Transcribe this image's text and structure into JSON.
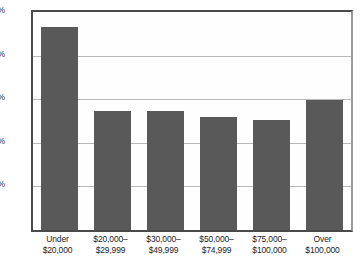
{
  "chart_data": {
    "type": "bar",
    "title": "",
    "subtitle": "",
    "xlabel": "",
    "ylabel": "",
    "categories": [
      "Under\n$20,000",
      "$20,000–\n$29,999",
      "$30,000–\n$49,999",
      "$50,000–\n$74,999",
      "$75,000–\n$100,000",
      "Over\n$100,000"
    ],
    "category_lines": [
      [
        "Under",
        "$20,000"
      ],
      [
        "$20,000–",
        "$29,999"
      ],
      [
        "$30,000–",
        "$49,999"
      ],
      [
        "$50,000–",
        "$74,999"
      ],
      [
        "$75,000–",
        "$100,000"
      ],
      [
        "Over",
        "$100,000"
      ]
    ],
    "values": [
      4.65,
      2.73,
      2.73,
      2.59,
      2.52,
      2.98
    ],
    "value_labels": [
      "4.65%",
      "2.73%",
      "2.73%",
      "2.59%",
      "2.52%",
      "2.98%"
    ],
    "ylim": [
      0,
      5
    ],
    "yticks": [
      0,
      1,
      2,
      3,
      4,
      5
    ],
    "ytick_labels": [
      "0%",
      "1%",
      "2%",
      "3%",
      "4%",
      "5%"
    ],
    "ytick_labels_shown": [
      "1%",
      "2%",
      "3%",
      "4%",
      "5%"
    ],
    "grid": true,
    "grid_axis": "y",
    "legend": false,
    "legend_position": "none",
    "bar_color": "#595959",
    "grid_color": "#b9b9b9",
    "axis_color": "#4a4a4a",
    "background_color": "#ffffff"
  }
}
